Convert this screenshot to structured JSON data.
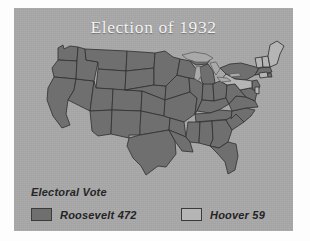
{
  "figure": {
    "title": "Election of 1932",
    "panel_color": "#a9a9a9",
    "page_background": "#fdfdfd",
    "title_color": "#f2f2f2"
  },
  "legend": {
    "heading": "Electoral Vote",
    "entries": [
      {
        "candidate": "Roosevelt",
        "electoral_votes": "472",
        "label": "Roosevelt 472",
        "swatch_color": "#6f6f6f",
        "swatch_name": "roosevelt-swatch"
      },
      {
        "candidate": "Hoover",
        "electoral_votes": "59",
        "label": "Hoover 59",
        "swatch_color": "#b5b5b5",
        "swatch_name": "hoover-swatch"
      }
    ]
  },
  "map": {
    "region": "United States",
    "roosevelt_fill": "#6f6f6f",
    "hoover_fill": "#b5b5b5",
    "border_color": "#333333",
    "lake_fill": "#a9a9a9",
    "states_roosevelt": [
      "Washington",
      "Oregon",
      "California",
      "Nevada",
      "Idaho",
      "Montana",
      "Wyoming",
      "Utah",
      "Arizona",
      "New Mexico",
      "Colorado",
      "North Dakota",
      "South Dakota",
      "Nebraska",
      "Kansas",
      "Oklahoma",
      "Texas",
      "Minnesota",
      "Iowa",
      "Missouri",
      "Arkansas",
      "Louisiana",
      "Wisconsin",
      "Illinois",
      "Michigan",
      "Indiana",
      "Ohio",
      "Kentucky",
      "Tennessee",
      "Mississippi",
      "Alabama",
      "Georgia",
      "Florida",
      "South Carolina",
      "North Carolina",
      "Virginia",
      "West Virginia",
      "Maryland",
      "New York",
      "New Jersey",
      "Massachusetts",
      "Rhode Island"
    ],
    "states_hoover": [
      "Pennsylvania",
      "Delaware",
      "Connecticut",
      "Vermont",
      "New Hampshire",
      "Maine"
    ]
  }
}
